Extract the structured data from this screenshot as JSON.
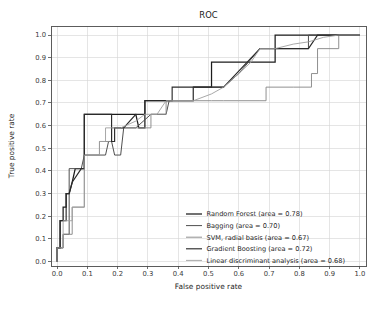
{
  "chart_data": {
    "type": "line",
    "title": "ROC",
    "xlabel": "False positive rate",
    "ylabel": "True positive rate",
    "xlim": [
      -0.02,
      1.02
    ],
    "ylim": [
      -0.02,
      1.04
    ],
    "grid": true,
    "legend_position": "lower right",
    "xticks": [
      "0.0",
      "0.1",
      "0.2",
      "0.3",
      "0.4",
      "0.5",
      "0.6",
      "0.7",
      "0.8",
      "0.9",
      "1.0"
    ],
    "xtick_values": [
      0.0,
      0.1,
      0.2,
      0.3,
      0.4,
      0.5,
      0.6,
      0.7,
      0.8,
      0.9,
      1.0
    ],
    "yticks": [
      "0.0",
      "0.1",
      "0.2",
      "0.3",
      "0.4",
      "0.5",
      "0.6",
      "0.7",
      "0.8",
      "0.9",
      "1.0"
    ],
    "ytick_values": [
      0.0,
      0.1,
      0.2,
      0.3,
      0.4,
      0.5,
      0.6,
      0.7,
      0.8,
      0.9,
      1.0
    ],
    "series": [
      {
        "name": "Random Forest",
        "area": "0.78",
        "legend_label": "Random Forest (area = 0.78)",
        "color": "#1c1c1c",
        "width": 1.25,
        "x": [
          0.0,
          0.0,
          0.01,
          0.01,
          0.02,
          0.02,
          0.03,
          0.03,
          0.04,
          0.05,
          0.06,
          0.08,
          0.09,
          0.09,
          0.26,
          0.27,
          0.29,
          0.29,
          0.38,
          0.38,
          0.45,
          0.45,
          0.51,
          0.51,
          0.72,
          0.72,
          1.0
        ],
        "y": [
          0.0,
          0.06,
          0.06,
          0.18,
          0.18,
          0.24,
          0.24,
          0.3,
          0.3,
          0.35,
          0.41,
          0.41,
          0.41,
          0.65,
          0.65,
          0.59,
          0.59,
          0.71,
          0.71,
          0.71,
          0.71,
          0.77,
          0.77,
          0.88,
          0.88,
          1.0,
          1.0
        ]
      },
      {
        "name": "Bagging",
        "area": "0.70",
        "legend_label": "Bagging (area = 0.70)",
        "color": "#4f4f4f",
        "width": 1.0,
        "x": [
          0.0,
          0.0,
          0.02,
          0.02,
          0.04,
          0.04,
          0.08,
          0.09,
          0.16,
          0.17,
          0.18,
          0.19,
          0.21,
          0.22,
          0.26,
          0.31,
          0.33,
          0.36,
          0.37,
          0.45,
          0.45,
          0.55,
          0.6,
          0.67,
          0.72,
          0.83,
          0.83,
          0.92,
          0.92,
          1.0
        ],
        "y": [
          0.0,
          0.06,
          0.06,
          0.12,
          0.12,
          0.41,
          0.41,
          0.47,
          0.47,
          0.53,
          0.53,
          0.47,
          0.47,
          0.59,
          0.59,
          0.65,
          0.65,
          0.65,
          0.71,
          0.71,
          0.77,
          0.77,
          0.83,
          0.94,
          0.94,
          0.94,
          1.0,
          1.0,
          1.0,
          1.0
        ]
      },
      {
        "name": "SVM, radial basis",
        "area": "0.67",
        "legend_label": "SVM, radial basis (area = 0.67)",
        "color": "#8a8a8a",
        "width": 0.95,
        "x": [
          0.0,
          0.0,
          0.02,
          0.02,
          0.05,
          0.05,
          0.09,
          0.09,
          0.14,
          0.14,
          0.18,
          0.18,
          0.21,
          0.21,
          0.31,
          0.31,
          0.36,
          0.36,
          0.45,
          0.45,
          0.51,
          0.55,
          0.6,
          0.67,
          0.69,
          0.69,
          0.78,
          0.78,
          0.84,
          0.84,
          0.86,
          0.86,
          0.93,
          0.93,
          1.0
        ],
        "y": [
          0.0,
          0.06,
          0.06,
          0.12,
          0.12,
          0.24,
          0.24,
          0.47,
          0.47,
          0.53,
          0.53,
          0.59,
          0.59,
          0.59,
          0.59,
          0.65,
          0.65,
          0.71,
          0.71,
          0.71,
          0.71,
          0.71,
          0.71,
          0.71,
          0.71,
          0.77,
          0.77,
          0.77,
          0.77,
          0.83,
          0.83,
          0.94,
          0.94,
          1.0,
          1.0
        ]
      },
      {
        "name": "Gradient Boosting",
        "area": "0.72",
        "legend_label": "Gradient Boosting (area = 0.72)",
        "color": "#2b2b2b",
        "width": 1.15,
        "x": [
          0.0,
          0.0,
          0.01,
          0.01,
          0.03,
          0.03,
          0.04,
          0.05,
          0.08,
          0.09,
          0.09,
          0.18,
          0.18,
          0.19,
          0.19,
          0.22,
          0.26,
          0.29,
          0.29,
          0.31,
          0.31,
          0.37,
          0.37,
          0.38,
          0.38,
          0.45,
          0.45,
          0.55,
          0.67,
          0.72,
          0.83,
          0.86,
          0.92,
          1.0
        ],
        "y": [
          0.0,
          0.06,
          0.06,
          0.18,
          0.18,
          0.3,
          0.3,
          0.35,
          0.41,
          0.41,
          0.65,
          0.65,
          0.53,
          0.53,
          0.59,
          0.59,
          0.65,
          0.65,
          0.71,
          0.71,
          0.71,
          0.71,
          0.71,
          0.71,
          0.77,
          0.77,
          0.77,
          0.77,
          0.94,
          0.94,
          0.94,
          1.0,
          1.0,
          1.0
        ]
      },
      {
        "name": "Linear discriminant analysis",
        "area": "0.68",
        "legend_label": "Linear discriminant analysis (area = 0.68)",
        "color": "#9e9e9e",
        "width": 0.9,
        "x": [
          0.0,
          0.0,
          0.02,
          0.02,
          0.05,
          0.05,
          0.09,
          0.09,
          0.14,
          0.14,
          0.16,
          0.16,
          0.21,
          0.21,
          0.26,
          0.29,
          0.33,
          0.36,
          0.45,
          0.51,
          0.55,
          0.6,
          0.64,
          0.67,
          0.72,
          0.78,
          0.83,
          0.88,
          0.93,
          1.0
        ],
        "y": [
          0.0,
          0.06,
          0.06,
          0.18,
          0.18,
          0.24,
          0.24,
          0.47,
          0.47,
          0.53,
          0.53,
          0.59,
          0.59,
          0.59,
          0.62,
          0.65,
          0.65,
          0.71,
          0.71,
          0.74,
          0.77,
          0.83,
          0.88,
          0.94,
          0.94,
          0.96,
          0.97,
          0.99,
          1.0,
          1.0
        ]
      }
    ]
  },
  "figure": {
    "background_color": "#ffffff",
    "grid_color": "#d4d4d4",
    "spine_color": "#4a4a4a"
  }
}
